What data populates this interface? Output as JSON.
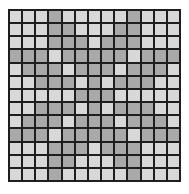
{
  "grid": {
    "rows": 13,
    "cols": 13,
    "colors": {
      "light": "#d8d8d8",
      "dark": "#a9a9a9",
      "border": "#1e1e1e"
    },
    "cells": [
      "LLLDLLLLLDLLL",
      "LLLDDLLLDDLLL",
      "LLLDDDLDDDLLL",
      "DDDLDDDDDLDDD",
      "LDDDLDDDLDDDL",
      "LLDDDLDLDDDLL",
      "LLLLLDDDLLLLL",
      "LLDDDLDLDDDLL",
      "LDDDLDDDLDDDL",
      "DDDLDDDDDLDDD",
      "LLLDDDLDDDLLL",
      "LLLDDLLLDDLLL",
      "LLLDLLLLLDLLL"
    ]
  }
}
